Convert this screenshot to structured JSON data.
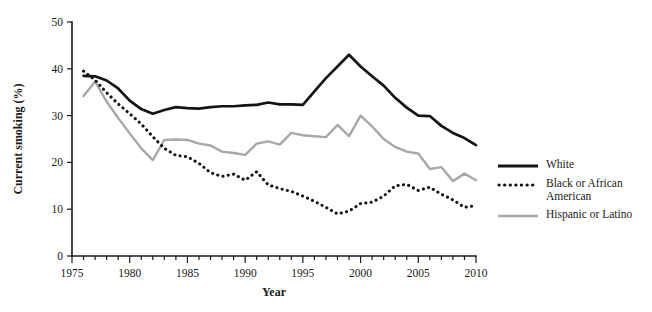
{
  "chart_data": {
    "type": "line",
    "title": "",
    "xlabel": "Year",
    "ylabel": "Current smoking (%)",
    "xlim": [
      1975,
      2010
    ],
    "ylim": [
      0,
      50
    ],
    "xticks_major": [
      1975,
      1980,
      1985,
      1990,
      1995,
      2000,
      2005,
      2010
    ],
    "xticks_minor_step": 1,
    "yticks": [
      0,
      10,
      20,
      30,
      40,
      50
    ],
    "grid": false,
    "legend_position": "right",
    "x": [
      1976,
      1977,
      1978,
      1979,
      1980,
      1981,
      1982,
      1983,
      1984,
      1985,
      1986,
      1987,
      1988,
      1989,
      1990,
      1991,
      1992,
      1993,
      1994,
      1995,
      1996,
      1997,
      1998,
      1999,
      2000,
      2001,
      2002,
      2003,
      2004,
      2005,
      2006,
      2007,
      2008,
      2009,
      2010
    ],
    "series": [
      {
        "name": "White",
        "style": "solid",
        "color": "#141414",
        "values": [
          38.5,
          38.4,
          37.5,
          35.8,
          33.2,
          31.4,
          30.4,
          31.2,
          31.8,
          31.6,
          31.5,
          31.8,
          32.0,
          32.0,
          32.2,
          32.3,
          32.8,
          32.4,
          32.4,
          32.3,
          35.2,
          38.0,
          40.5,
          43.0,
          40.5,
          38.4,
          36.4,
          33.8,
          31.7,
          30.0,
          29.9,
          27.8,
          26.3,
          25.2,
          23.7
        ]
      },
      {
        "name": "Black or African American",
        "style": "dotted",
        "color": "#141414",
        "values": [
          39.5,
          37.6,
          34.9,
          32.5,
          30.4,
          28.2,
          25.5,
          23.0,
          21.5,
          21.2,
          19.8,
          17.8,
          17.0,
          17.5,
          16.2,
          18.0,
          15.2,
          14.4,
          13.8,
          12.8,
          11.7,
          10.4,
          9.0,
          9.6,
          11.2,
          11.5,
          12.8,
          15.0,
          15.3,
          14.0,
          14.7,
          13.2,
          12.0,
          10.4,
          10.8
        ]
      },
      {
        "name": "Hispanic or Latino",
        "style": "solid",
        "color": "#a8a8a8",
        "values": [
          34.2,
          37.3,
          33.0,
          29.5,
          26.2,
          23.0,
          20.5,
          24.8,
          24.9,
          24.8,
          24.0,
          23.6,
          22.3,
          22.0,
          21.6,
          24.0,
          24.5,
          23.8,
          26.3,
          25.8,
          25.6,
          25.4,
          28.0,
          25.6,
          30.0,
          27.7,
          25.0,
          23.3,
          22.3,
          21.9,
          18.6,
          19.0,
          16.0,
          17.6,
          16.2
        ]
      }
    ],
    "legend": [
      {
        "label": "White",
        "style": "solid",
        "color": "#141414"
      },
      {
        "label": "Black or African American",
        "style": "dotted",
        "color": "#141414"
      },
      {
        "label": "Hispanic or Latino",
        "style": "solid",
        "color": "#a8a8a8"
      }
    ]
  },
  "axes": {
    "y_label": "Current smoking (%)",
    "x_label": "Year",
    "y_tick_labels": [
      "0",
      "10",
      "20",
      "30",
      "40",
      "50"
    ],
    "x_tick_labels": [
      "1975",
      "1980",
      "1985",
      "1990",
      "1995",
      "2000",
      "2005",
      "2010"
    ]
  },
  "legend": {
    "items": [
      {
        "label": "White"
      },
      {
        "label": "Black or African American"
      },
      {
        "label": "Hispanic or Latino"
      }
    ]
  }
}
